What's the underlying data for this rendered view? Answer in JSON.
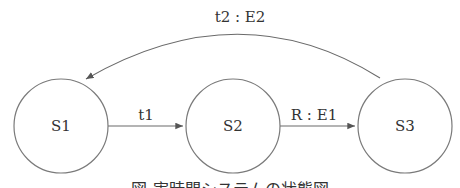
{
  "diagram": {
    "type": "state-diagram",
    "states": [
      {
        "id": "S1",
        "label": "S1"
      },
      {
        "id": "S2",
        "label": "S2"
      },
      {
        "id": "S3",
        "label": "S3"
      }
    ],
    "transitions": [
      {
        "from": "S1",
        "to": "S2",
        "label": "t1"
      },
      {
        "from": "S2",
        "to": "S3",
        "label": "R : E1"
      },
      {
        "from": "S3",
        "to": "S1",
        "label": "t2 : E2"
      }
    ],
    "caption": "図 実時間システムの状態図"
  }
}
